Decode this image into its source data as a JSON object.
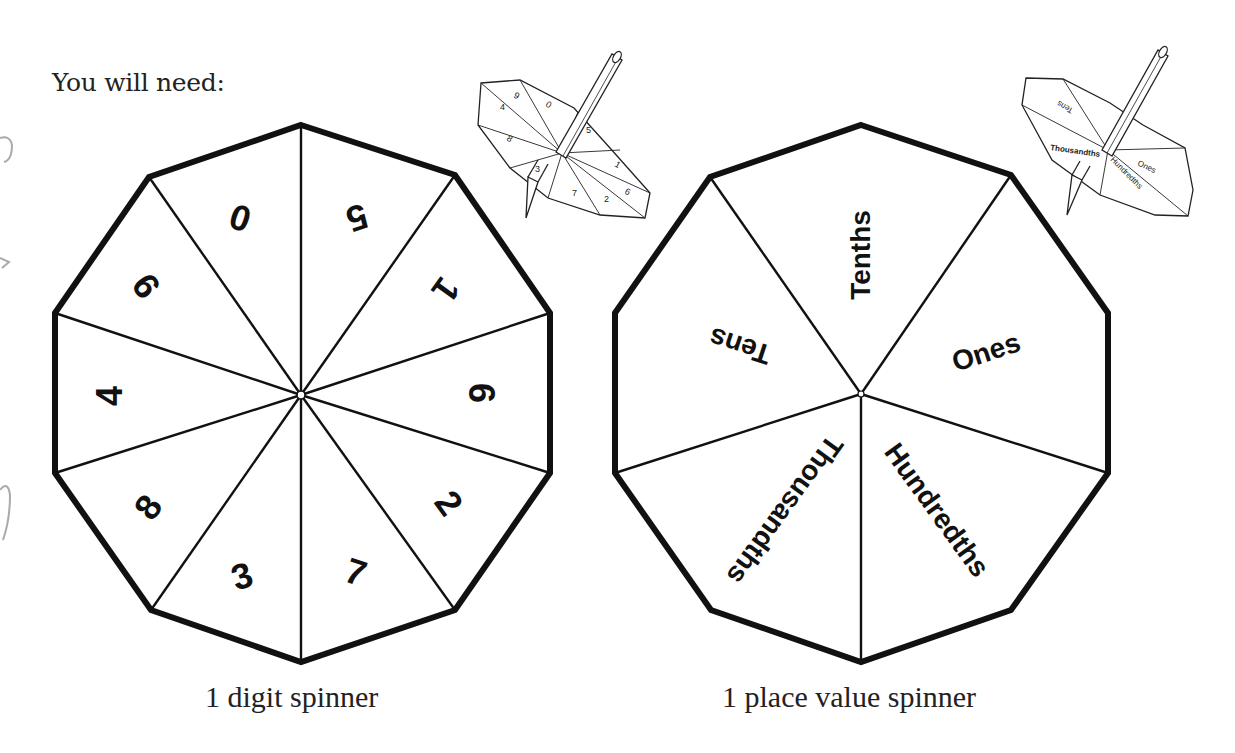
{
  "page": {
    "heading": "You will need:",
    "colors": {
      "ink": "#111111",
      "paper": "#ffffff",
      "sketch": "#999999"
    }
  },
  "digit_spinner": {
    "caption": "1 digit spinner",
    "shape": "decagon",
    "sections": 10,
    "labels": [
      "0",
      "5",
      "1",
      "6",
      "2",
      "7",
      "3",
      "8",
      "4",
      "9"
    ]
  },
  "place_value_spinner": {
    "caption": "1 place value spinner",
    "shape": "decagon",
    "sections": 5,
    "labels": [
      "Tenths",
      "Ones",
      "Hundredths",
      "Thousandths",
      "Tens"
    ]
  },
  "illustrations": {
    "digit_top": {
      "description": "pencil through digit spinner",
      "labels": [
        "0",
        "5",
        "1",
        "6",
        "2",
        "7",
        "3",
        "8",
        "4",
        "9"
      ]
    },
    "place_value_top": {
      "description": "pencil through place value spinner",
      "labels": [
        "Tens",
        "Tenths",
        "Ones",
        "Hundredths",
        "Thousandths"
      ]
    }
  }
}
